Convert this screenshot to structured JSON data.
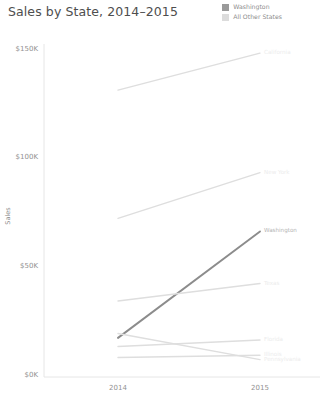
{
  "title": "Sales by State, 2014–2015",
  "legend": {
    "items": [
      {
        "label": "Washington",
        "color": "#9a9a9a",
        "swatch": "legend-swatch-washington"
      },
      {
        "label": "All Other States",
        "color": "#dcdcdc",
        "swatch": "legend-swatch-all-other-states"
      }
    ]
  },
  "axes": {
    "y_title": "Sales",
    "y_ticks": [
      "$150K",
      "$100K",
      "$50K",
      "$0K"
    ],
    "x_ticks": [
      "2014",
      "2015"
    ]
  },
  "colors": {
    "highlight": "#8c8c8c",
    "muted": "#dddddd",
    "axis": "#e3e3e3",
    "text": "#919191",
    "title": "#4e4e4e"
  },
  "chart_data": {
    "type": "line",
    "title": "Sales by State, 2014–2015",
    "xlabel": "",
    "ylabel": "Sales",
    "x": [
      "2014",
      "2015"
    ],
    "ylim": [
      0,
      150000
    ],
    "ytick_values": [
      150000,
      100000,
      50000,
      0
    ],
    "ytick_labels": [
      "$150K",
      "$100K",
      "$50K",
      "$0K"
    ],
    "grid": false,
    "legend_position": "top-right",
    "legend_entries": [
      "Washington",
      "All Other States"
    ],
    "series": [
      {
        "name": "California",
        "group": "All Other States",
        "values": [
          132000,
          149000
        ],
        "color": "#dedede",
        "highlight": false,
        "label": "California"
      },
      {
        "name": "New York",
        "group": "All Other States",
        "values": [
          73000,
          94000
        ],
        "color": "#dedede",
        "highlight": false,
        "label": "New York"
      },
      {
        "name": "Washington",
        "group": "Washington",
        "values": [
          18000,
          67000
        ],
        "color": "#8c8c8c",
        "highlight": true,
        "label": "Washington"
      },
      {
        "name": "Texas",
        "group": "All Other States",
        "values": [
          35000,
          43000
        ],
        "color": "#dedede",
        "highlight": false,
        "label": "Texas"
      },
      {
        "name": "Pennsylvania",
        "group": "All Other States",
        "values": [
          20000,
          8000
        ],
        "color": "#dedede",
        "highlight": false,
        "label": "Pennsylvania"
      },
      {
        "name": "Florida",
        "group": "All Other States",
        "values": [
          14000,
          17000
        ],
        "color": "#dedede",
        "highlight": false,
        "label": "Florida"
      },
      {
        "name": "Illinois",
        "group": "All Other States",
        "values": [
          9000,
          10000
        ],
        "color": "#dedede",
        "highlight": false,
        "label": "Illinois"
      }
    ]
  }
}
